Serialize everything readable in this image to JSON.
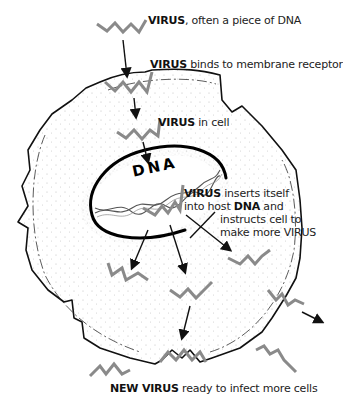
{
  "diagram": {
    "labels": {
      "step1": {
        "keyword": "VIRUS",
        "text": ", often a piece of DNA"
      },
      "step2": {
        "keyword": "VIRUS",
        "text": " binds to membrane receptor"
      },
      "step3": {
        "keyword": "VIRUS",
        "text": " in cell"
      },
      "step4": {
        "keyword": "VIRUS",
        "line1": " inserts itself",
        "line2a": "into host ",
        "line2b": "DNA",
        "line2c": " and",
        "line3": "instructs cell to",
        "line4": "make more VIRUS"
      },
      "step5": {
        "keyword": "NEW VIRUS",
        "text": " ready to infect more cells"
      }
    },
    "nucleus_label": "DNA",
    "colors": {
      "virus": "#8a8a8a",
      "outline": "#111111",
      "stipple": "#bdbdbd",
      "background": "#ffffff"
    },
    "icons": [
      "virus-zigzag-icon",
      "arrow-icon",
      "dna-helix-icon",
      "cell-membrane",
      "nucleus-outline"
    ]
  }
}
